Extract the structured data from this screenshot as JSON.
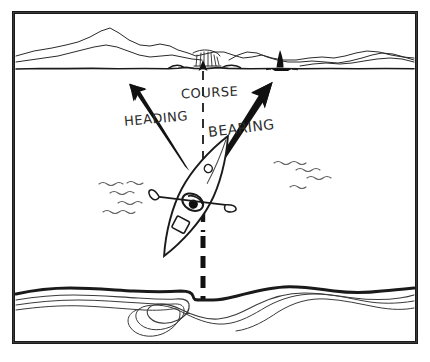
{
  "figure": {
    "style": "hand-drawn pen-and-ink line illustration",
    "frame": {
      "visible": true,
      "color": "#1a1a1a",
      "thickness_px": 3
    },
    "background_color": "#ffffff",
    "ink_color": "#1a1a1a",
    "light_ink_color": "#5a5a5a"
  },
  "labels": {
    "heading": "HEADING",
    "course": "COURSE",
    "bearing": "BEARING"
  },
  "caption": "",
  "vectors": [
    {
      "name": "heading",
      "label": "HEADING",
      "style": "solid tapered arrow",
      "color": "#111111",
      "from": {
        "x": 186,
        "y": 168
      },
      "to": {
        "x": 133,
        "y": 85
      },
      "direction_deg": -58,
      "description": "direction the kayak bow is pointed"
    },
    {
      "name": "course",
      "label": "COURSE",
      "style": "dashed line, thin above craft and bold below",
      "color": "#111111",
      "from": {
        "x": 203,
        "y": 300
      },
      "to": {
        "x": 203,
        "y": 62
      },
      "direction_deg": -90,
      "description": "actual track made good over the ground"
    },
    {
      "name": "bearing",
      "label": "BEARING",
      "style": "solid tapered arrow",
      "color": "#111111",
      "from": {
        "x": 198,
        "y": 196
      },
      "to": {
        "x": 272,
        "y": 84
      },
      "direction_deg": -56,
      "description": "direction to the distant sailboat landmark"
    }
  ],
  "scene": {
    "far_shore": {
      "name": "far shoreline with mountains",
      "horizon_y": 69,
      "landmark": {
        "name": "waterfall-cliff",
        "x": 207,
        "y": 56
      }
    },
    "sailboat": {
      "name": "sailboat",
      "x": 280,
      "y": 68,
      "fill": "#111111"
    },
    "kayak": {
      "name": "sea kayak seen from above",
      "center": {
        "x": 196,
        "y": 196
      },
      "tilt_deg": 28,
      "parts": [
        "hull",
        "cockpit",
        "paddler",
        "paddle",
        "deck-hatch",
        "bow-fitting"
      ]
    },
    "waves_left": {
      "count": 4,
      "x": 100,
      "y": 182
    },
    "waves_right": {
      "count": 4,
      "x": 272,
      "y": 158
    },
    "near_shore": {
      "name": "near shoreline with depth contours",
      "bold_line_y": 290,
      "contour_count": 3
    }
  }
}
